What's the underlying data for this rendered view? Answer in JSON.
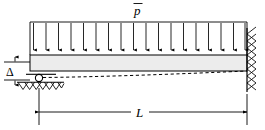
{
  "figure": {
    "type": "structural-beam-diagram",
    "width": 265,
    "height": 130
  },
  "labels": {
    "load": "p",
    "load_notation": "p-with-overbar",
    "length": "L",
    "settlement": "Δ"
  },
  "colors": {
    "line": "#000000",
    "beam_fill": "#ececec",
    "background": "#ffffff",
    "dashed": "#000000"
  },
  "beam": {
    "left_x": 30,
    "right_x": 247,
    "top_y": 55,
    "bottom_y": 71,
    "fill": "#ececec"
  },
  "load": {
    "baseline_y": 22,
    "arrow_tip_y": 54,
    "arrow_count": 18,
    "first_x": 33,
    "last_x": 245,
    "label_x": 138,
    "label_y": 14
  },
  "supports": {
    "left": {
      "kind": "roller",
      "circle_cx": 39,
      "circle_cy": 78,
      "circle_r": 3.6,
      "ground_y": 83,
      "ground_x1": 17,
      "ground_x2": 64,
      "hatch_count": 7
    },
    "right": {
      "kind": "fixed",
      "wall_x": 247,
      "wall_top": 28,
      "wall_bottom": 92,
      "hatch_count": 9
    }
  },
  "deflection": {
    "style": "dashed",
    "start_x": 43,
    "start_y": 77,
    "end_x": 247,
    "end_y": 71
  },
  "dimensions": {
    "length": {
      "y": 112,
      "x1": 39,
      "x2": 247,
      "label": "L",
      "label_x": 140,
      "label_y": 117
    },
    "settlement": {
      "x": 15,
      "top_y": 62,
      "bottom_y": 80,
      "ref_line_1_y": 62,
      "ref_line_2_y": 80,
      "ref_x1": 4,
      "ref_x2": 30,
      "label": "Δ",
      "label_x": 9,
      "label_y": 75
    }
  }
}
